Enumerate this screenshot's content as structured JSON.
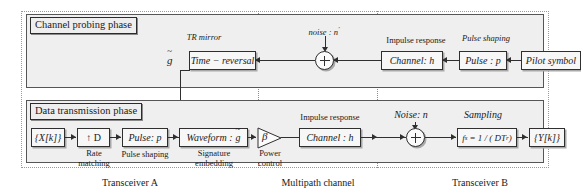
{
  "diagram": {
    "phases": [
      {
        "id": "probing",
        "label": "Channel probing phase"
      },
      {
        "id": "data",
        "label": "Data transmission phase"
      }
    ],
    "columns": [
      {
        "id": "transceiver-a",
        "label": "Transceiver A"
      },
      {
        "id": "multipath-channel",
        "label": "Multipath channel"
      },
      {
        "id": "transceiver-b",
        "label": "Transceiver B"
      }
    ],
    "probing_row": {
      "caption_tr_mirror": "TR mirror",
      "signal_g_tilde": "g",
      "signal_g_tilde_accent": "~",
      "block_time_reversal": "Time − reversal",
      "noise_label": "noise : n",
      "noise_superscript": "'",
      "caption_impulse_response": "Impulse response",
      "block_channel": "Channel: h",
      "caption_pulse_shaping": "Pulse shaping",
      "block_pulse": "Pulse : p",
      "block_pilot_symbol": "Pilot symbol",
      "sum_symbol": "+"
    },
    "data_row": {
      "block_input": "{X[k]}",
      "block_rate": "↑ D",
      "caption_rate_line1": "Rate",
      "caption_rate_line2": "matching",
      "block_pulse": "Pulse: p",
      "caption_pulse_shaping": "Pulse shaping",
      "block_waveform_prefix": "Waveform :",
      "block_waveform_symbol": "g",
      "block_waveform_accent": "~",
      "caption_signature_line1": "Signature",
      "caption_signature_line2": "embedding",
      "amplifier_symbol": "β",
      "caption_power_line1": "Power",
      "caption_power_line2": "control",
      "caption_impulse_response": "Impulse response",
      "block_channel": "Channel : h",
      "noise_label": "Noise: n",
      "caption_sampling": "Sampling",
      "block_sampler_lhs": "f",
      "block_sampler_lhs_sub": "s",
      "block_sampler_rhs": "= 1 / ( DT",
      "block_sampler_rhs_sub": "r",
      "block_sampler_close": " )",
      "block_output": "{Y[k]}",
      "sum_symbol": "+"
    },
    "colors": {
      "panel_fill": "#efefef",
      "box_fill": "#f7f7f7",
      "stroke": "#2f2f2f",
      "shadow": "#a8a8a8",
      "page": "#ffffff"
    }
  }
}
